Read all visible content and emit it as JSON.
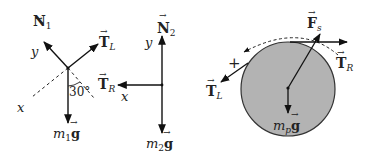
{
  "diagram": {
    "type": "free-body diagrams",
    "panels": [
      {
        "name": "block-1",
        "forces": [
          {
            "symbol": "N",
            "subscript": "1",
            "label": "N₁",
            "direction": "up-left (normal)"
          },
          {
            "symbol": "T",
            "subscript": "L",
            "label": "T_L",
            "direction": "up-right"
          },
          {
            "symbol": "m₁g",
            "label": "m₁g",
            "direction": "down"
          }
        ],
        "axes": {
          "x": "x",
          "y": "y"
        },
        "angle": "30°"
      },
      {
        "name": "block-2",
        "forces": [
          {
            "symbol": "N",
            "subscript": "2",
            "label": "N₂",
            "direction": "up"
          },
          {
            "symbol": "T",
            "subscript": "R",
            "label": "T_R",
            "direction": "left"
          },
          {
            "symbol": "m₂g",
            "label": "m₂g",
            "direction": "down"
          }
        ],
        "axes": {
          "x": "x",
          "y": "y"
        }
      },
      {
        "name": "pulley",
        "forces": [
          {
            "symbol": "F",
            "subscript": "s",
            "label": "F_s",
            "direction": "up-right"
          },
          {
            "symbol": "T",
            "subscript": "R",
            "label": "T_R",
            "direction": "right (tangent top)"
          },
          {
            "symbol": "T",
            "subscript": "L",
            "label": "T_L",
            "direction": "down-left (tangent)"
          },
          {
            "symbol": "m_p g",
            "label": "m_p g",
            "direction": "down"
          }
        ],
        "rotation_sign": "+",
        "fill_color": "#b3b3b3"
      }
    ],
    "labels": {
      "N": "N",
      "sub1": "1",
      "sub2": "2",
      "T": "T",
      "subL": "L",
      "subR": "R",
      "y": "y",
      "x": "x",
      "angle": "30°",
      "m": "m",
      "g": "g",
      "subp": "p",
      "F": "F",
      "subs": "s",
      "plus": "+"
    }
  }
}
